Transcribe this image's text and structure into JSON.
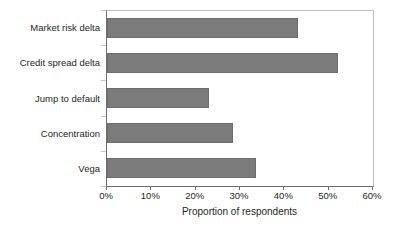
{
  "chart_data": {
    "type": "bar",
    "orientation": "horizontal",
    "title": "",
    "xlabel": "Proportion of respondents",
    "ylabel": "",
    "categories": [
      "Market risk delta",
      "Credit spread delta",
      "Jump to default",
      "Concentration",
      "Vega"
    ],
    "values": [
      43,
      52,
      23,
      28.5,
      33.5
    ],
    "value_labels": [
      "43%",
      "52%",
      "23%",
      "28.5%",
      "33.5%"
    ],
    "xlim": [
      0,
      60
    ],
    "xticks": [
      0,
      10,
      20,
      30,
      40,
      50,
      60
    ],
    "xticklabels": [
      "0%",
      "10%",
      "20%",
      "30%",
      "40%",
      "50%",
      "60%"
    ],
    "grid": false,
    "legend": null,
    "series": [
      {
        "name": "Proportion of respondents",
        "values": [
          43,
          52,
          23,
          28.5,
          33.5
        ]
      }
    ],
    "colors": {
      "bar_fill": "#7b7b7b",
      "bar_stroke": "#6d6d6d",
      "axis": "#6f6f6f",
      "frame": "#bfbfbf",
      "text": "#231f20",
      "background": "#ffffff"
    }
  }
}
